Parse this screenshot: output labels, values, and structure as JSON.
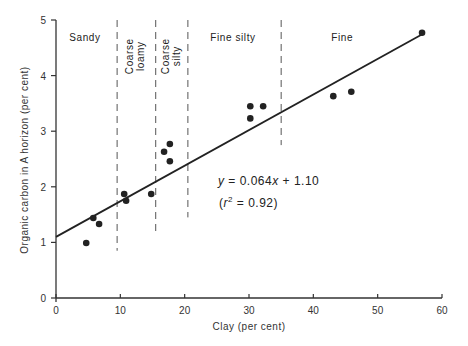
{
  "chart_data": {
    "type": "scatter",
    "title": "",
    "xlabel": "Clay (per cent)",
    "ylabel": "Organic carbon in A horizon (per cent)",
    "xlim": [
      0,
      60
    ],
    "ylim": [
      0,
      5
    ],
    "xticks": [
      0,
      10,
      20,
      30,
      40,
      50,
      60
    ],
    "yticks": [
      0,
      1,
      2,
      3,
      4,
      5
    ],
    "grid": false,
    "legend": null,
    "series": [
      {
        "name": "Observations",
        "points": [
          {
            "x": 4.7,
            "y": 0.99
          },
          {
            "x": 5.8,
            "y": 1.44
          },
          {
            "x": 6.7,
            "y": 1.33
          },
          {
            "x": 10.6,
            "y": 1.87
          },
          {
            "x": 10.9,
            "y": 1.75
          },
          {
            "x": 14.8,
            "y": 1.87
          },
          {
            "x": 16.8,
            "y": 2.63
          },
          {
            "x": 17.7,
            "y": 2.77
          },
          {
            "x": 17.7,
            "y": 2.46
          },
          {
            "x": 30.2,
            "y": 3.23
          },
          {
            "x": 30.2,
            "y": 3.45
          },
          {
            "x": 32.2,
            "y": 3.45
          },
          {
            "x": 43.1,
            "y": 3.63
          },
          {
            "x": 45.9,
            "y": 3.71
          },
          {
            "x": 56.9,
            "y": 4.77
          }
        ]
      }
    ],
    "regression": {
      "slope": 0.064,
      "intercept": 1.1,
      "r_squared": 0.92,
      "x_range": [
        0,
        57
      ],
      "equation_label": "y = 0.064x + 1.10",
      "r2_label": "(r² = 0.92)"
    },
    "class_boundaries": [
      {
        "x": 9.5,
        "y_from": 0.85,
        "y_to": 5.0
      },
      {
        "x": 15.5,
        "y_from": 1.2,
        "y_to": 5.0
      },
      {
        "x": 20.5,
        "y_from": 1.45,
        "y_to": 5.0
      },
      {
        "x": 35.0,
        "y_from": 2.75,
        "y_to": 5.0
      }
    ],
    "classes": [
      {
        "label": "Sandy",
        "orientation": "horizontal",
        "x": 4.5,
        "y": 4.7
      },
      {
        "label": "Coarse loamy",
        "lines": [
          "Coarse",
          "loamy"
        ],
        "orientation": "vertical",
        "x": 12.5,
        "y": 4.6
      },
      {
        "label": "Coarse silty",
        "lines": [
          "Coarse",
          "silty"
        ],
        "orientation": "vertical",
        "x": 18.0,
        "y": 4.6
      },
      {
        "label": "Fine silty",
        "orientation": "horizontal",
        "x": 27.5,
        "y": 4.7
      },
      {
        "label": "Fine",
        "orientation": "horizontal",
        "x": 44.5,
        "y": 4.7
      }
    ]
  },
  "labels": {
    "xlabel": "Clay (per cent)",
    "ylabel": "Organic carbon in A horizon (per cent)",
    "equation": "y = 0.064x + 1.10",
    "eq_y": "y",
    "eq_rest1": " = 0.064",
    "eq_x": "x",
    "eq_rest2": " + 1.10",
    "r2_open": "(",
    "r2_r": "r",
    "r2_sup": "2",
    "r2_rest": " = 0.92)"
  },
  "colors": {
    "ink": "#222222",
    "axis": "#333333",
    "dashed": "#555555",
    "ylabel": "#3a3a55"
  }
}
